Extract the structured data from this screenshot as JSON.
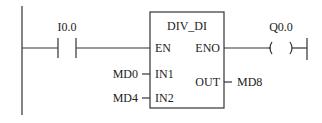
{
  "diagram": {
    "type": "ladder",
    "contact": {
      "address": "I0.0",
      "kind": "normally-open"
    },
    "block": {
      "name": "DIV_DI",
      "pins": {
        "en": "EN",
        "eno": "ENO",
        "in1": "IN1",
        "in2": "IN2",
        "out": "OUT"
      }
    },
    "operands": {
      "in1": "MD0",
      "in2": "MD4",
      "out": "MD8"
    },
    "coil": {
      "address": "Q0.0"
    }
  }
}
